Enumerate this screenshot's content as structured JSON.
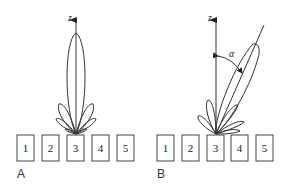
{
  "figure": {
    "panels": [
      {
        "id": "A",
        "label": "A",
        "axis_label": "z",
        "elements": [
          "1",
          "2",
          "3",
          "4",
          "5"
        ],
        "beam": "broadside main lobe along z with symmetric side lobes"
      },
      {
        "id": "B",
        "label": "B",
        "axis_label": "z",
        "angle_label": "α",
        "elements": [
          "1",
          "2",
          "3",
          "4",
          "5"
        ],
        "beam": "main lobe steered by angle alpha from z axis"
      }
    ]
  },
  "colors": {
    "line": "#333333",
    "background": "#ffffff"
  }
}
